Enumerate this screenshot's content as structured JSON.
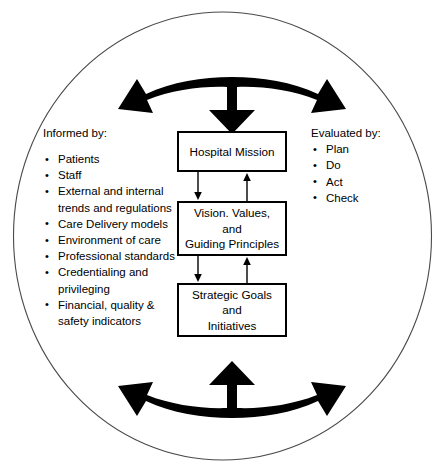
{
  "diagram": {
    "colors": {
      "stroke": "#000000",
      "background": "#ffffff",
      "ellipse_stroke": "#4a4a4a"
    },
    "informed": {
      "heading": "Informed by:",
      "items": [
        "Patients",
        "Staff",
        "External and internal trends and regulations",
        "Care Delivery models",
        "Environment of care",
        "Professional standards",
        "Credentialing and privileging",
        "Financial, quality & safety indicators"
      ]
    },
    "evaluated": {
      "heading": "Evaluated by:",
      "items": [
        "Plan",
        "Do",
        "Act",
        "Check"
      ]
    },
    "boxes": [
      {
        "id": "mission",
        "label": "Hospital Mission"
      },
      {
        "id": "vision",
        "label": "Vision. Values,\nand\nGuiding Principles"
      },
      {
        "id": "goals",
        "label": "Strategic Goals\nand\nInitiatives"
      }
    ],
    "connectors": [
      {
        "id": "mission-to-vision",
        "direction": "down",
        "from": "mission",
        "to": "vision"
      },
      {
        "id": "vision-to-mission",
        "direction": "up",
        "from": "vision",
        "to": "mission"
      },
      {
        "id": "vision-to-goals",
        "direction": "down",
        "from": "vision",
        "to": "goals"
      },
      {
        "id": "goals-to-vision",
        "direction": "up",
        "from": "goals",
        "to": "vision"
      }
    ],
    "curved_arrows": [
      {
        "id": "top-split-arrow",
        "heads": [
          "left",
          "down",
          "right"
        ],
        "position": "top"
      },
      {
        "id": "bottom-split-arrow",
        "heads": [
          "left",
          "up",
          "right"
        ],
        "position": "bottom"
      }
    ],
    "enclosure": {
      "shape": "ellipse"
    }
  }
}
